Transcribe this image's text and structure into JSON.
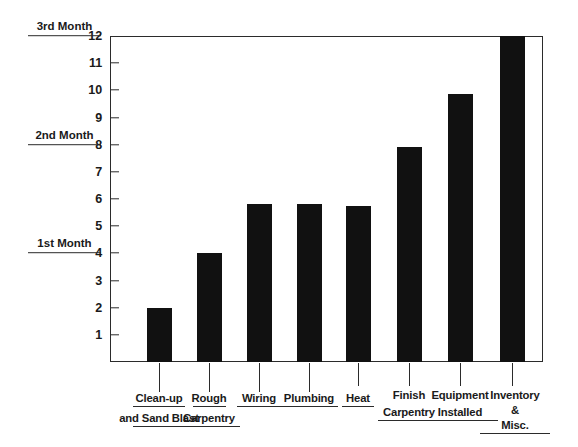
{
  "chart_data": {
    "type": "bar",
    "title": "",
    "xlabel": "",
    "ylabel": "",
    "ylim": [
      0,
      12
    ],
    "grid": false,
    "legend": "none",
    "orientation": "vertical",
    "bar_color": "#111111",
    "axis_color": "#2b2b2b",
    "categories": [
      "Clean-up and Sand Blast",
      "Rough Carpentry",
      "Wiring",
      "Plumbing",
      "Heat",
      "Finish Carpentry",
      "Equipment Installed",
      "Inventory & Misc."
    ],
    "values": [
      2,
      4,
      5.8,
      5.8,
      5.75,
      7.9,
      9.85,
      12
    ],
    "yticks": [
      1,
      2,
      3,
      4,
      5,
      6,
      7,
      8,
      9,
      10,
      11,
      12
    ],
    "ytick_labels": [
      "1",
      "2",
      "3",
      "4",
      "5",
      "6",
      "7",
      "8",
      "9",
      "10",
      "11",
      "12"
    ],
    "annotations": [
      {
        "label": "1st Month",
        "value": 4
      },
      {
        "label": "2nd Month",
        "value": 8
      },
      {
        "label": "3rd Month",
        "value": 12
      }
    ]
  },
  "category_labels": [
    {
      "line1": "Clean-up",
      "line2": "and Sand Blast"
    },
    {
      "line1": "Rough",
      "line2": "Carpentry"
    },
    {
      "line1": "Wiring",
      "line2": ""
    },
    {
      "line1": "Plumbing",
      "line2": ""
    },
    {
      "line1": "Heat",
      "line2": ""
    },
    {
      "line1": "Finish",
      "line2": "Carpentry"
    },
    {
      "line1": "Equipment",
      "line2": "Installed"
    },
    {
      "line1": "Inventory",
      "line2": "&",
      "line3": "Misc."
    }
  ]
}
